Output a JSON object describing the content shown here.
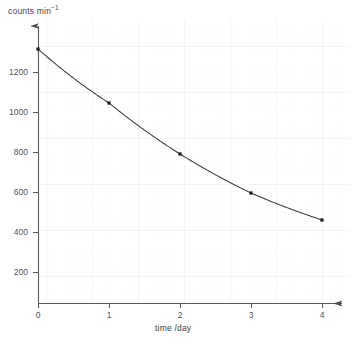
{
  "chart_data": {
    "type": "line",
    "title": "",
    "subtitle": "",
    "xlabel": "time /day",
    "ylabel_text": "counts min",
    "ylabel_exponent": "−1",
    "ylabel_full": "counts min⁻¹",
    "x": [
      0,
      1,
      2,
      3,
      4
    ],
    "values": [
      1270,
      1000,
      745,
      550,
      415
    ],
    "series": [
      {
        "name": "count rate",
        "values": [
          1270,
          1000,
          745,
          550,
          415
        ]
      }
    ],
    "x_ticks": [
      "0",
      "1",
      "2",
      "3",
      "4"
    ],
    "x_tick_values": [
      0,
      1,
      2,
      3,
      4
    ],
    "y_ticks": [
      "200",
      "400",
      "600",
      "800",
      "1000",
      "1200"
    ],
    "y_tick_values": [
      200,
      400,
      600,
      800,
      1000,
      1200
    ],
    "origin_label": "0",
    "xlim": [
      0,
      4.35
    ],
    "ylim": [
      0,
      1400
    ],
    "grid": true,
    "grid_major_step_x": 1,
    "grid_minor_per_major": 5,
    "legend": "none",
    "marker": "square",
    "marker_color": "#1a1a1a",
    "line_color": "#3c3c3c",
    "axis_color": "#555555",
    "grid_major_color": "#e9ecef",
    "grid_minor_color": "#f4f6f7",
    "background": "#ffffff",
    "annotations": []
  }
}
